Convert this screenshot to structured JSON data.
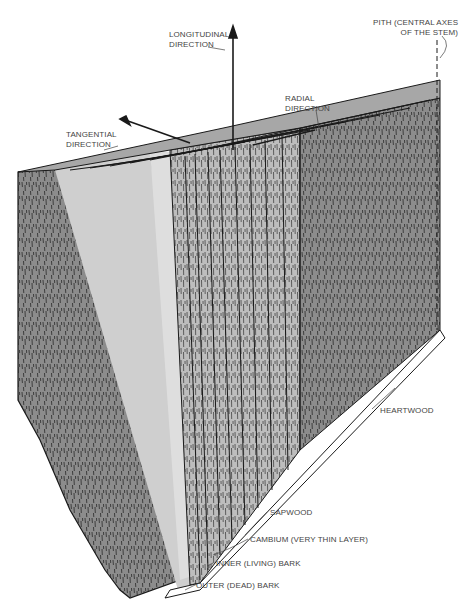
{
  "figure": {
    "type": "wood-block-cross-section",
    "colors": {
      "end_grain_face": "#8c8c8c",
      "sapwood_band": "#cfcfcf",
      "radial_face": "#bdbdbd",
      "top_face": "#a7a7a7",
      "ink": "#1a1a1a",
      "label_text": "#444444"
    }
  },
  "directions": {
    "longitudinal": {
      "line1": "LONGITUDINAL",
      "line2": "DIRECTION"
    },
    "radial": {
      "line1": "RADIAL",
      "line2": "DIRECTION"
    },
    "tangential": {
      "line1": "TANGENTIAL",
      "line2": "DIRECTION"
    },
    "pith": {
      "line1": "PITH (CENTRAL AXES",
      "line2": "OF THE STEM)"
    }
  },
  "layers": [
    {
      "label": "HEARTWOOD"
    },
    {
      "label": "SAPWOOD"
    },
    {
      "label": "CAMBIUM (VERY THIN LAYER)"
    },
    {
      "label": "INNER (LIVING) BARK"
    },
    {
      "label": "OUTER (DEAD) BARK"
    }
  ]
}
